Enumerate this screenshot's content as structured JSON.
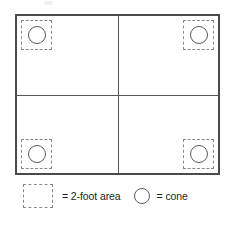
{
  "diagram": {
    "grid": {
      "rows": 2,
      "columns": 2,
      "border_color": "#4a4a4a",
      "divider_color": "#55555a",
      "background": "#ffffff",
      "quadrants": [
        {
          "position": "top-left",
          "marker": {
            "shape": "dashed-square",
            "label": "2-foot area",
            "contains": "cone"
          }
        },
        {
          "position": "top-right",
          "marker": {
            "shape": "dashed-square",
            "label": "2-foot area",
            "contains": "cone"
          }
        },
        {
          "position": "bottom-left",
          "marker": {
            "shape": "dashed-square",
            "label": "2-foot area",
            "contains": "cone"
          }
        },
        {
          "position": "bottom-right",
          "marker": {
            "shape": "dashed-square",
            "label": "2-foot area",
            "contains": "cone"
          }
        }
      ]
    },
    "legend": {
      "items": [
        {
          "icon": "dashed-square-icon",
          "equals": "=",
          "label": "= 2-foot area",
          "swatch_color": "#8a8a8a"
        },
        {
          "icon": "circle-icon",
          "equals": "=",
          "label": "= cone",
          "swatch_color": "#5b5b5b"
        }
      ]
    }
  }
}
